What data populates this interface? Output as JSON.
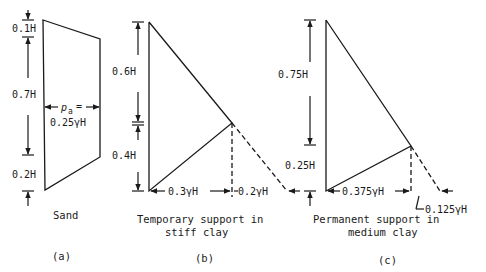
{
  "figure": {
    "panels": [
      {
        "id": "a",
        "label": "(a)",
        "caption_line1": "Sand",
        "caption_line2": "",
        "dims": [
          "0.1H",
          "0.7H",
          "0.2H"
        ],
        "pressure_label": "p",
        "pressure_sub": "a",
        "pressure_eq": "=",
        "pressure_value": "0.25γH"
      },
      {
        "id": "b",
        "label": "(b)",
        "caption_line1": "Temporary support in",
        "caption_line2": "stiff clay",
        "dims": [
          "0.6H",
          "0.4H"
        ],
        "base_values": [
          "0.3γH",
          "0.2γH"
        ]
      },
      {
        "id": "c",
        "label": "(c)",
        "caption_line1": "Permanent support in",
        "caption_line2": "medium clay",
        "dims": [
          "0.75H",
          "0.25H"
        ],
        "base_values": [
          "0.375γH",
          "0.125γH"
        ]
      }
    ]
  }
}
